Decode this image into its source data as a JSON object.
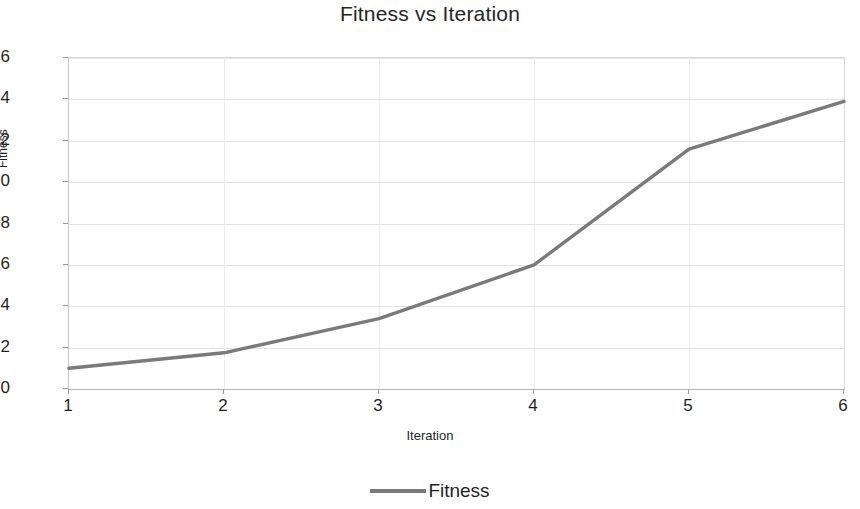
{
  "chart_data": {
    "type": "line",
    "title": "Fitness vs Iteration",
    "xlabel": "Iteration",
    "ylabel": "Fitness",
    "categories": [
      1,
      2,
      3,
      4,
      5,
      6
    ],
    "x_tick_labels": [
      "1",
      "2",
      "3",
      "4",
      "5",
      "6"
    ],
    "y_tick_labels": [
      "0",
      "2",
      "4",
      "6",
      "8",
      "10",
      "12",
      "14",
      "16"
    ],
    "y_ticks": [
      0,
      2,
      4,
      6,
      8,
      10,
      12,
      14,
      16
    ],
    "ylim": [
      0,
      16
    ],
    "xlim": [
      1,
      6
    ],
    "grid": "horizontal-and-vertical-faint",
    "legend_position": "bottom-center",
    "series": [
      {
        "name": "Fitness",
        "color": "#7a7a7a",
        "values": [
          1.0,
          1.75,
          3.4,
          6.0,
          11.6,
          13.9
        ]
      }
    ]
  },
  "legend": {
    "entries": [
      {
        "label": "Fitness"
      }
    ]
  },
  "colors": {
    "series_line": "#7a7a7a",
    "gridline": "#e3e3e3",
    "axis": "#b5b5b5",
    "text": "#1f1f1f"
  }
}
